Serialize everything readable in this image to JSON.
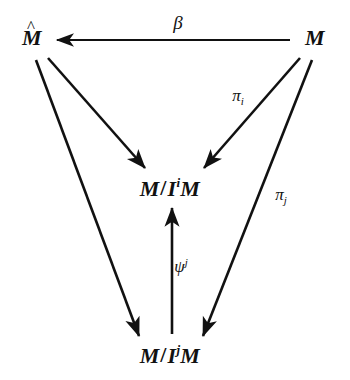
{
  "figure": {
    "type": "commutative-diagram",
    "background_color": "#ffffff",
    "ink_color": "#111111"
  },
  "nodes": {
    "m_hat": {
      "name": "M-hat",
      "base": "M",
      "accent": "^",
      "x": 32,
      "y": 38
    },
    "m": {
      "name": "M",
      "base": "M",
      "x": 315,
      "y": 38
    },
    "quotient_i": {
      "name": "M/I^i M",
      "prefix": "M",
      "slash": "/",
      "ideal": "I",
      "exponent": "i",
      "suffix": "M",
      "x": 170,
      "y": 188
    },
    "quotient_j": {
      "name": "M/I^j M",
      "prefix": "M",
      "slash": "/",
      "ideal": "I",
      "exponent": "j",
      "suffix": "M",
      "x": 170,
      "y": 355
    }
  },
  "edges": [
    {
      "id": "beta",
      "from": "m",
      "to": "m_hat",
      "label": "β",
      "label_x": 178,
      "label_y": 22,
      "direction": "leftward"
    },
    {
      "id": "mhat-to-quotient-i",
      "from": "m_hat",
      "to": "quotient_i",
      "label": "",
      "direction": "down-right"
    },
    {
      "id": "mhat-to-quotient-j",
      "from": "m_hat",
      "to": "quotient_j",
      "label": "",
      "direction": "down-right"
    },
    {
      "id": "pi-i",
      "from": "m",
      "to": "quotient_i",
      "label": "π",
      "label_sub": "i",
      "label_x": 238,
      "label_y": 97,
      "direction": "down-left"
    },
    {
      "id": "pi-j",
      "from": "m",
      "to": "quotient_j",
      "label": "π",
      "label_sub": "j",
      "label_x": 281,
      "label_y": 196,
      "direction": "down-left"
    },
    {
      "id": "psi",
      "from": "quotient_j",
      "to": "quotient_i",
      "label": "ψ",
      "label_sup": "j",
      "label_x": 181,
      "label_y": 266,
      "direction": "up"
    }
  ]
}
